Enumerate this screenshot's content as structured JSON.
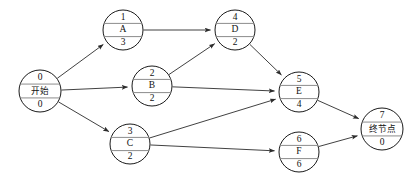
{
  "diagram": {
    "type": "directed-graph",
    "canvas": {
      "width": 414,
      "height": 183,
      "background": "#ffffff"
    },
    "style": {
      "node_stroke": "#1a1a1a",
      "node_fill": "#ffffff",
      "divider_stroke": "#8c8c8c",
      "edge_stroke": "#2b2b2b"
    },
    "node_field_order": [
      "top",
      "middle",
      "bottom"
    ],
    "nodes": [
      {
        "id": "start",
        "top": "0",
        "middle": "开始",
        "bottom": "0",
        "cjk": true,
        "cx": 40,
        "cy": 91,
        "r": 21
      },
      {
        "id": "A",
        "top": "1",
        "middle": "A",
        "bottom": "3",
        "cjk": false,
        "cx": 123,
        "cy": 30,
        "r": 20
      },
      {
        "id": "B",
        "top": "2",
        "middle": "B",
        "bottom": "2",
        "cjk": false,
        "cx": 152,
        "cy": 86,
        "r": 20
      },
      {
        "id": "C",
        "top": "3",
        "middle": "C",
        "bottom": "2",
        "cjk": false,
        "cx": 130,
        "cy": 144,
        "r": 20
      },
      {
        "id": "D",
        "top": "4",
        "middle": "D",
        "bottom": "2",
        "cjk": false,
        "cx": 235,
        "cy": 30,
        "r": 20
      },
      {
        "id": "E",
        "top": "5",
        "middle": "E",
        "bottom": "4",
        "cjk": false,
        "cx": 299,
        "cy": 92,
        "r": 20
      },
      {
        "id": "F",
        "top": "6",
        "middle": "F",
        "bottom": "6",
        "cjk": false,
        "cx": 299,
        "cy": 152,
        "r": 20
      },
      {
        "id": "end",
        "top": "7",
        "middle": "终节点",
        "bottom": "0",
        "cjk": true,
        "cx": 382,
        "cy": 129,
        "r": 21
      }
    ],
    "edges": [
      {
        "id": "start-A",
        "from": "start",
        "to": "A",
        "label": ""
      },
      {
        "id": "start-B",
        "from": "start",
        "to": "B",
        "label": ""
      },
      {
        "id": "start-C",
        "from": "start",
        "to": "C",
        "label": ""
      },
      {
        "id": "A-D",
        "from": "A",
        "to": "D",
        "label": ""
      },
      {
        "id": "B-D",
        "from": "B",
        "to": "D",
        "label": ""
      },
      {
        "id": "B-E",
        "from": "B",
        "to": "E",
        "label": ""
      },
      {
        "id": "C-E",
        "from": "C",
        "to": "E",
        "label": ""
      },
      {
        "id": "C-F",
        "from": "C",
        "to": "F",
        "label": ""
      },
      {
        "id": "D-E",
        "from": "D",
        "to": "E",
        "label": ""
      },
      {
        "id": "E-end",
        "from": "E",
        "to": "end",
        "label": ""
      },
      {
        "id": "F-end",
        "from": "F",
        "to": "end",
        "label": ""
      }
    ]
  }
}
